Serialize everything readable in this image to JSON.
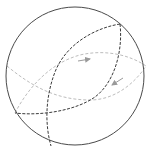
{
  "diagram": {
    "type": "sphere-great-circles",
    "colors": {
      "background": "#ffffff",
      "sphere_outline": "#4a4a4a",
      "dark_dashed": "#3a3a3a",
      "light_dashed": "#bdbdbd",
      "arrow": "#9a9a9a"
    },
    "sphere": {
      "cx": 75,
      "cy": 76,
      "r": 69
    },
    "curves": {
      "dark_arc_left": "M120,24 C95,28 66,44 55,72 C45,98 45,125 51,146",
      "dark_arc_right": "M120,24 C123,50 115,82 95,97 C75,111 40,116 15,113",
      "light_arc_upper": "M15,113 C28,88 50,63 80,55 C105,49 130,55 146,66",
      "light_arc_lower": "M7,66 C30,85 55,100 90,100 C115,100 135,83 146,66"
    },
    "arrows": [
      {
        "name": "arrow-right",
        "direction": "right",
        "x1": 78,
        "y1": 61,
        "x2": 90,
        "y2": 59
      },
      {
        "name": "arrow-left",
        "direction": "lower-left",
        "x1": 123,
        "y1": 78,
        "x2": 112,
        "y2": 85
      }
    ]
  }
}
